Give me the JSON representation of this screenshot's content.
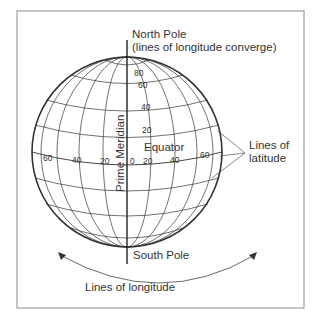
{
  "figure": {
    "labels": {
      "north_pole": "North Pole",
      "north_pole_note": "(lines of longitude converge)",
      "south_pole": "South Pole",
      "equator": "Equator",
      "prime_meridian": "Prime Meridian",
      "lines_of_latitude_1": "Lines of",
      "lines_of_latitude_2": "latitude",
      "lines_of_longitude": "Lines of longitude"
    },
    "latitude_ticks": [
      "80",
      "60",
      "40",
      "20"
    ],
    "longitude_ticks": {
      "west": [
        "60",
        "40",
        "20"
      ],
      "zero": "0",
      "east": [
        "20",
        "40",
        "60"
      ]
    },
    "colors": {
      "line": "#333333",
      "frame": "#888888",
      "text": "#333333"
    }
  }
}
